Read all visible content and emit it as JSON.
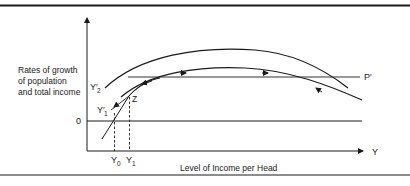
{
  "figure": {
    "y_axis_label_lines": [
      "Rates of growth",
      "of population",
      "and total income"
    ],
    "x_axis_label": "Level of Income per Head",
    "x_axis_symbol": "Y",
    "origin_label": "0",
    "line_labels": {
      "p_prime": "P′",
      "y2_prime": "Y′",
      "y2_sub": "2",
      "y1_prime": "Y′",
      "y1_sub": "1",
      "z": "Z",
      "y0": "Y",
      "y0_sub": "0",
      "y1": "Y",
      "y1_sub_x": "1"
    },
    "curves": [
      {
        "name": "Y2' total income growth (upper)"
      },
      {
        "name": "Y1' total income growth (lower)"
      },
      {
        "name": "P' population growth (horizontal)"
      }
    ],
    "colors": {
      "ink": "#1a1a1a",
      "background": "#ffffff"
    }
  }
}
